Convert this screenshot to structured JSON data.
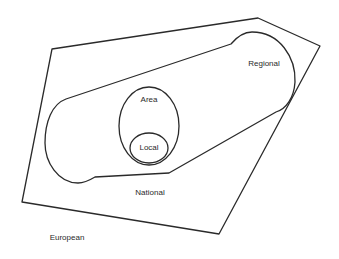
{
  "diagram": {
    "type": "nested-regions",
    "stroke_color": "#2a2a2a",
    "background": "#ffffff",
    "regions": [
      {
        "id": "european",
        "label": "European",
        "label_pos": [
          67,
          238
        ],
        "shape": "outside"
      },
      {
        "id": "national",
        "label": "National",
        "label_pos": [
          150,
          193
        ],
        "shape": "polygon",
        "points": [
          [
            52,
            49
          ],
          [
            258,
            18
          ],
          [
            320,
            46
          ],
          [
            219,
            234
          ],
          [
            22,
            202
          ]
        ]
      },
      {
        "id": "regional",
        "label": "Regional",
        "label_pos": [
          264,
          64
        ],
        "shape": "capsule"
      },
      {
        "id": "area",
        "label": "Area",
        "label_pos": [
          149,
          100
        ],
        "shape": "ellipse",
        "cx": 149,
        "cy": 126,
        "rx": 30,
        "ry": 39
      },
      {
        "id": "local",
        "label": "Local",
        "label_pos": [
          149,
          148
        ],
        "shape": "ellipse",
        "cx": 149,
        "cy": 148,
        "rx": 19,
        "ry": 15
      }
    ]
  }
}
